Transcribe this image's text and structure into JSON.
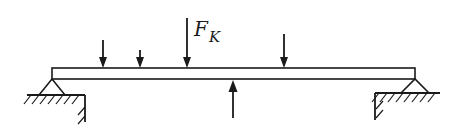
{
  "diagram": {
    "type": "simply-supported-beam",
    "colors": {
      "ink": "#1a1a1a",
      "background": "#ffffff"
    },
    "beam": {
      "x1": 52,
      "x2": 415,
      "top": 68,
      "bottom": 79
    },
    "supports": [
      {
        "name": "left-pin-support",
        "apex_x": 52,
        "apex_y": 79,
        "half_width": 13,
        "base_y": 95,
        "ground_x1": 27,
        "ground_x2": 85,
        "wall_x": 85,
        "wall_bottom": 122
      },
      {
        "name": "right-pin-support",
        "apex_x": 415,
        "apex_y": 79,
        "half_width": 14,
        "base_y": 93,
        "ground_x1": 375,
        "ground_x2": 440,
        "wall_x": 375,
        "wall_bottom": 120
      }
    ],
    "loads_down": [
      {
        "name": "load-1",
        "x": 103,
        "y_start": 40,
        "y_end": 68
      },
      {
        "name": "load-2",
        "x": 140,
        "y_start": 50,
        "y_end": 68
      },
      {
        "name": "load-fk",
        "x": 187,
        "y_start": 18,
        "y_end": 68,
        "label": "F",
        "subscript": "K"
      },
      {
        "name": "load-4",
        "x": 284,
        "y_start": 34,
        "y_end": 68
      }
    ],
    "reaction_up": {
      "name": "reaction-force",
      "x": 233,
      "y_start": 118,
      "y_end": 80
    },
    "force_label": {
      "main": "F",
      "subscript": "K"
    }
  }
}
